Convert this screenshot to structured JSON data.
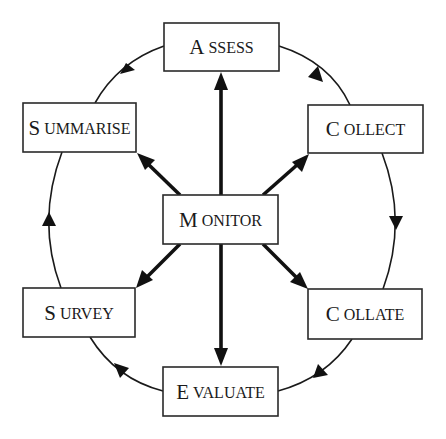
{
  "diagram": {
    "center": {
      "id": "monitor",
      "label": "MONITOR"
    },
    "nodes": [
      {
        "id": "assess",
        "label": "ASSESS",
        "x": 164,
        "y": 23,
        "w": 115,
        "h": 48
      },
      {
        "id": "collect",
        "label": "COLLECT",
        "x": 308,
        "y": 105,
        "w": 115,
        "h": 48
      },
      {
        "id": "collate",
        "label": "COLLATE",
        "x": 308,
        "y": 289,
        "w": 114,
        "h": 50
      },
      {
        "id": "evaluate",
        "label": "EVALUATE",
        "x": 163,
        "y": 367,
        "w": 115,
        "h": 49
      },
      {
        "id": "survey",
        "label": "SURVEY",
        "x": 23,
        "y": 288,
        "w": 112,
        "h": 49
      },
      {
        "id": "summarise",
        "label": "SUMMARISE",
        "x": 23,
        "y": 103,
        "w": 113,
        "h": 49
      },
      {
        "id": "monitor",
        "label": "MONITOR",
        "x": 163,
        "y": 195,
        "w": 115,
        "h": 49
      }
    ],
    "cycle_order": [
      "ASSESS",
      "COLLECT",
      "COLLATE",
      "EVALUATE",
      "SURVEY",
      "SUMMARISE"
    ],
    "cycle_direction": "clockwise",
    "spokes_from": "MONITOR",
    "spokes_to": [
      "ASSESS",
      "COLLECT",
      "COLLATE",
      "EVALUATE",
      "SURVEY",
      "SUMMARISE"
    ],
    "colors": {
      "line": "#1a1a1a",
      "box_fill": "#ffffff",
      "text": "#1a1a1a"
    }
  }
}
